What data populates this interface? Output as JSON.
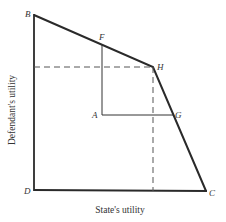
{
  "diagram": {
    "axes": {
      "xlabel": "State's utility",
      "ylabel": "Defendant's utility"
    },
    "points": {
      "B": "B",
      "D": "D",
      "C": "C",
      "H": "H",
      "F": "F",
      "A": "A",
      "G": "G"
    },
    "colors": {
      "line": "#2a2a2a",
      "dash": "#555555",
      "text": "#333333"
    }
  }
}
